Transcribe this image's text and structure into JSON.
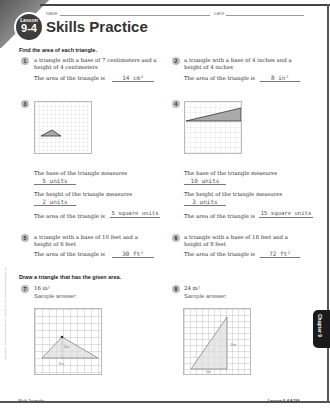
{
  "header": {
    "lesson_label": "Lesson",
    "lesson_number": "9-4",
    "name_label": "NAME",
    "date_label": "DATE",
    "title": "Skills Practice"
  },
  "sections": [
    {
      "heading": "Find the area of each triangle."
    },
    {
      "heading": "Draw a triangle that has the given area."
    }
  ],
  "problems": [
    {
      "number": "1",
      "text": "a triangle with a base of 7 centimeters and a height of 4 centimeters",
      "prompt": "The area of the triangle is",
      "answer": "14 cm²"
    },
    {
      "number": "2",
      "text": "a triangle with a base of 4 inches and a height of 4 inches",
      "prompt": "The area of the triangle is",
      "answer": "8 in²"
    },
    {
      "number": "3",
      "base_prompt": "The base of the triangle measures",
      "base_answer": "5 units",
      "height_prompt": "The height of the triangle measures",
      "height_answer": "2 units",
      "prompt": "The area of the triangle is",
      "answer": "5 square units"
    },
    {
      "number": "4",
      "base_prompt": "The base of the triangle measures",
      "base_answer": "10 units",
      "height_prompt": "The height of the triangle measures",
      "height_answer": "3 units",
      "prompt": "The area of the triangle is",
      "answer": "15 square units"
    },
    {
      "number": "5",
      "text": "a triangle with a base of 10 feet and a height of 6 feet",
      "prompt": "The area of the triangle is",
      "answer": "30 ft²"
    },
    {
      "number": "6",
      "text": "a triangle with a base of 18 feet and a height of 8 feet",
      "prompt": "The area of the triangle is",
      "answer": "72 ft²"
    },
    {
      "number": "7",
      "area": "16 in²",
      "sample_label": "Sample answer:",
      "label_height": "4 in.",
      "label_base": "8 in."
    },
    {
      "number": "8",
      "area": "24 m²",
      "sample_label": "Sample answer:",
      "label_height": "8 m",
      "label_base": "6 m"
    }
  ],
  "side_tab": {
    "label": "Chapter 9"
  },
  "copyright": "Copyright © Macmillan/McGraw-Hill, a division of The McGraw-Hill Companies, Inc.",
  "footer": {
    "left": "Math Triumphs",
    "right": "Lesson 9-4   A199"
  }
}
